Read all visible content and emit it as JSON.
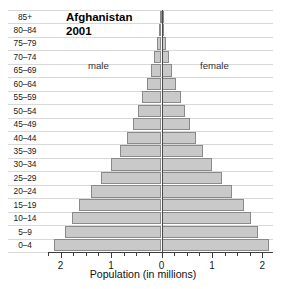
{
  "chart_data": {
    "type": "bar",
    "subtype": "population-pyramid",
    "title": "Afghanistan",
    "subtitle": "2001",
    "xlabel": "Population (in millions)",
    "ylabel": "",
    "xlim": [
      -2.25,
      2.25
    ],
    "xticks": [
      2,
      1,
      0,
      1,
      2
    ],
    "xtick_labels": [
      "2",
      "1",
      "0",
      "1",
      "2"
    ],
    "minor_tick_step": 0.25,
    "grid": true,
    "legend_position": "inline",
    "annotations": [
      "male",
      "female"
    ],
    "categories": [
      "85+",
      "80–84",
      "75–79",
      "70–74",
      "65–69",
      "60–64",
      "55–59",
      "50–54",
      "45–49",
      "40–44",
      "35–39",
      "30–34",
      "25–29",
      "20–24",
      "15–19",
      "10–14",
      "5–9",
      "0–4"
    ],
    "series": [
      {
        "name": "male",
        "side": "left",
        "values": [
          0.02,
          0.05,
          0.09,
          0.14,
          0.21,
          0.29,
          0.38,
          0.47,
          0.57,
          0.69,
          0.83,
          1.0,
          1.2,
          1.4,
          1.63,
          1.78,
          1.92,
          2.13
        ]
      },
      {
        "name": "female",
        "side": "right",
        "values": [
          0.02,
          0.05,
          0.09,
          0.14,
          0.21,
          0.29,
          0.38,
          0.47,
          0.57,
          0.69,
          0.83,
          1.0,
          1.2,
          1.4,
          1.63,
          1.78,
          1.92,
          2.13
        ]
      }
    ],
    "colors": {
      "bar_fill": "#c9c9c9",
      "bar_stroke": "#8a8a8a",
      "axis": "#3c3c3c",
      "gridline": "#d8d8d8",
      "center_line": "#4a4a4a",
      "text": "#1a1a1a"
    }
  },
  "labels": {
    "male": "male",
    "female": "female",
    "title_line1": "Afghanistan",
    "title_line2": "2001",
    "axis_title": "Population (in millions)"
  }
}
